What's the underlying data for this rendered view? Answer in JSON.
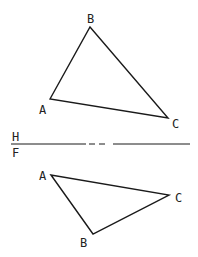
{
  "diagram": {
    "stroke_color": "#1a1a1a",
    "top_view": {
      "points": {
        "A": {
          "label": "A",
          "x": 50,
          "y": 99,
          "lx": 39,
          "ly": 114
        },
        "B": {
          "label": "B",
          "x": 90,
          "y": 27,
          "lx": 87,
          "ly": 23
        },
        "C": {
          "label": "C",
          "x": 168,
          "y": 118,
          "lx": 172,
          "ly": 128
        }
      }
    },
    "front_view": {
      "points": {
        "A": {
          "label": "A",
          "x": 51,
          "y": 175,
          "lx": 39,
          "ly": 180
        },
        "B": {
          "label": "B",
          "x": 93,
          "y": 234,
          "lx": 80,
          "ly": 247
        },
        "C": {
          "label": "C",
          "x": 169,
          "y": 195,
          "lx": 175,
          "ly": 202
        }
      }
    },
    "fold_line": {
      "y": 144,
      "x_start": 11,
      "x_end": 190,
      "upper_label": "H",
      "lower_label": "F"
    }
  }
}
